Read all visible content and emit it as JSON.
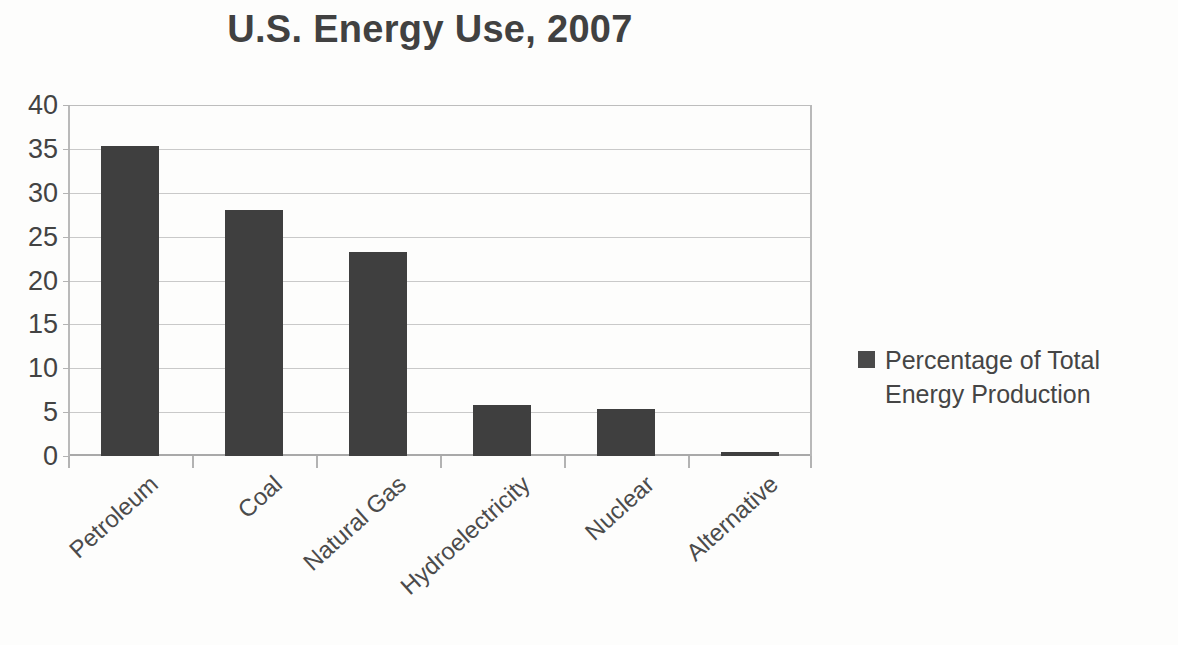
{
  "chart_data": {
    "type": "bar",
    "title": "U.S. Energy Use, 2007",
    "xlabel": "",
    "ylabel": "",
    "categories": [
      "Petroleum",
      "Coal",
      "Natural Gas",
      "Hydroelectricity",
      "Nuclear",
      "Alternative"
    ],
    "values": [
      35.3,
      28.0,
      23.3,
      5.8,
      5.4,
      0.4
    ],
    "series": [
      {
        "name": "Percentage of Total Energy Production",
        "values": [
          35.3,
          28.0,
          23.3,
          5.8,
          5.4,
          0.4
        ]
      }
    ],
    "ylim": [
      0,
      40
    ],
    "ytick_step": 5,
    "yticks": [
      "40",
      "35",
      "30",
      "25",
      "20",
      "15",
      "10",
      "5",
      "0"
    ],
    "grid": true,
    "legend_position": "right",
    "bar_color": "#3f3f3f",
    "gridline_color": "#c9c9c9",
    "axis_color": "#b3b3b3",
    "background_color": "#fdfdfc",
    "title_color": "#414141"
  },
  "legend": {
    "entries": [
      {
        "label": "Percentage of Total Energy Production",
        "color": "#4a4a4a"
      }
    ]
  }
}
